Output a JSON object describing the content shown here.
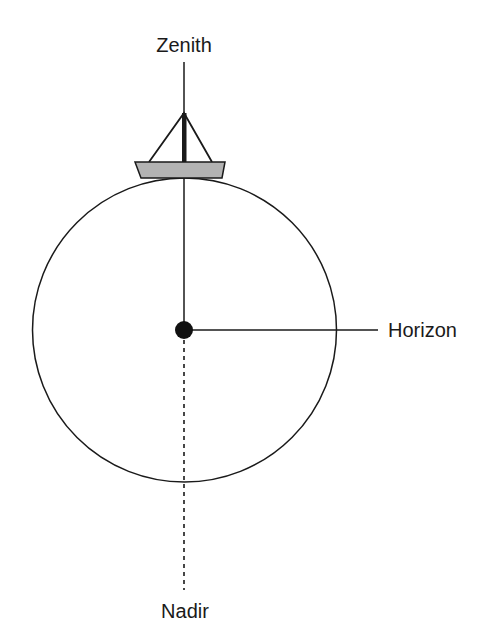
{
  "diagram": {
    "labels": {
      "zenith": "Zenith",
      "horizon": "Horizon",
      "nadir": "Nadir"
    },
    "icons": [
      "sailboat-icon",
      "observer-dot-icon"
    ],
    "colors": {
      "stroke": "#1a1a1a",
      "hull_fill": "#b3b3b3",
      "background": "#ffffff"
    }
  }
}
